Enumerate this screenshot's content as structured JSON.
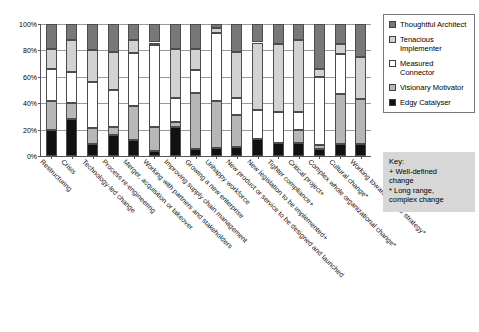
{
  "chart_data": {
    "type": "bar",
    "stacked": true,
    "percent": true,
    "title": "",
    "xlabel": "",
    "ylabel": "",
    "ylim": [
      0,
      100
    ],
    "ytick_labels": [
      "0%",
      "20%",
      "40%",
      "60%",
      "80%",
      "100%"
    ],
    "ytick_values": [
      0,
      20,
      40,
      60,
      80,
      100
    ],
    "grid": true,
    "legend_position": "right",
    "categories": [
      "Restructuring",
      "Crisis",
      "Technology-led change",
      "Process re-engineering",
      "Merger, acquisition or takeover",
      "Working with partners and stakeholders",
      "Improving supply chain management",
      "Growing a new enterprise",
      "Unhappy workforce",
      "New product or service to be designed and launched",
      "New legislation to be implemented+",
      "Tighter compliance+",
      "Critical project+",
      "Complex whole organizational change*",
      "Cultural change*",
      "Working towards 5-year strategy*"
    ],
    "series": [
      {
        "name": "Edgy Catalyser",
        "color": "#111111",
        "values": [
          20,
          28,
          9,
          16,
          12,
          4,
          22,
          5,
          6,
          7,
          13,
          10,
          10,
          5,
          9,
          9
        ]
      },
      {
        "name": "Visionary Motivator",
        "color": "#b7b7b7",
        "values": [
          22,
          12,
          12,
          6,
          26,
          18,
          4,
          43,
          36,
          24,
          0,
          0,
          10,
          3,
          38,
          34
        ]
      },
      {
        "name": "Measured Connector",
        "color": "#ffffff",
        "values": [
          24,
          24,
          35,
          28,
          40,
          62,
          18,
          17,
          51,
          13,
          22,
          23,
          13,
          52,
          30,
          0
        ]
      },
      {
        "name": "Tenacious Implementer",
        "color": "#d2d2d2",
        "values": [
          15,
          24,
          24,
          29,
          10,
          2,
          37,
          16,
          4,
          35,
          51,
          52,
          55,
          6,
          8,
          32
        ]
      },
      {
        "name": "Thoughtful Architect",
        "color": "#787878",
        "values": [
          19,
          12,
          20,
          21,
          12,
          14,
          19,
          19,
          3,
          21,
          14,
          15,
          12,
          34,
          15,
          25
        ]
      }
    ]
  },
  "legend": {
    "items": [
      {
        "label": "Thoughtful Architect",
        "swatch": "#787878"
      },
      {
        "label": "Tenacious Implementer",
        "swatch": "#d2d2d2"
      },
      {
        "label": "Measured Connector",
        "swatch": "#ffffff"
      },
      {
        "label": "Visionary Motivator",
        "swatch": "#b7b7b7"
      },
      {
        "label": "Edgy Catalyser",
        "swatch": "#111111"
      }
    ]
  },
  "key": {
    "heading": "Key:",
    "line1": "+ Well-defined",
    "line2": "change",
    "line3": "* Long range,",
    "line4": "complex change"
  }
}
